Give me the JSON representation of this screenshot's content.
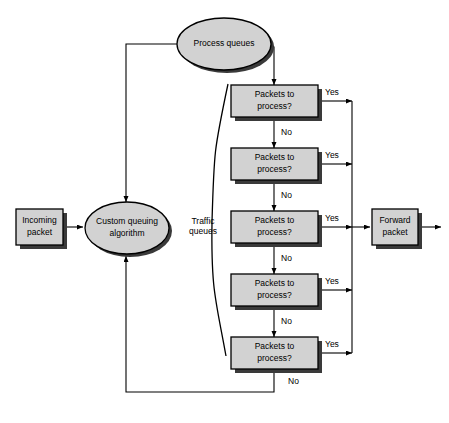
{
  "diagram": {
    "background_color": "#ffffff",
    "shape_fill": "#d2d2d2",
    "shape_stroke": "#000000",
    "shadow_color": "#3a3a3a",
    "line_color": "#000000"
  },
  "nodes": {
    "process_queues": {
      "label": "Process queues",
      "shape": "ellipse",
      "cx": 224,
      "cy": 44,
      "rx": 47,
      "ry": 26
    },
    "incoming_packet": {
      "label_line1": "Incoming",
      "label_line2": "packet",
      "shape": "rect",
      "x": 16,
      "y": 209,
      "w": 47,
      "h": 36
    },
    "custom_queuing_algorithm": {
      "label_line1": "Custom queuing",
      "label_line2": "algorithm",
      "shape": "ellipse",
      "cx": 127,
      "cy": 228,
      "rx": 42,
      "ry": 26
    },
    "forward_packet": {
      "label_line1": "Forward",
      "label_line2": "packet",
      "shape": "rect",
      "x": 372,
      "y": 209,
      "w": 46,
      "h": 36
    }
  },
  "traffic_queues_brace": {
    "label_line1": "Traffic",
    "label_line2": "queues",
    "label_x": 203,
    "label_y1": 222,
    "label_y2": 232
  },
  "decisions": [
    {
      "id": "decision-1",
      "label_line1": "Packets to",
      "label_line2": "process?",
      "x": 231,
      "y": 85,
      "w": 87,
      "h": 32,
      "yes_label": "Yes",
      "no_label": "No"
    },
    {
      "id": "decision-2",
      "label_line1": "Packets to",
      "label_line2": "process?",
      "x": 231,
      "y": 148,
      "w": 87,
      "h": 32,
      "yes_label": "Yes",
      "no_label": "No"
    },
    {
      "id": "decision-3",
      "label_line1": "Packets to",
      "label_line2": "process?",
      "x": 231,
      "y": 211,
      "w": 87,
      "h": 32,
      "yes_label": "Yes",
      "no_label": "No"
    },
    {
      "id": "decision-4",
      "label_line1": "Packets to",
      "label_line2": "process?",
      "x": 231,
      "y": 274,
      "w": 87,
      "h": 32,
      "yes_label": "Yes",
      "no_label": "No"
    },
    {
      "id": "decision-5",
      "label_line1": "Packets to",
      "label_line2": "process?",
      "x": 231,
      "y": 337,
      "w": 87,
      "h": 32,
      "yes_label": "Yes",
      "no_label": "No"
    }
  ],
  "final_no": {
    "label": "No",
    "x": 288,
    "y": 382
  },
  "routing": {
    "yes_bus_x": 352,
    "loop_left_x": 126,
    "loop_bottom_y": 392,
    "top_rail_y": 44,
    "feed_down_x": 274
  }
}
